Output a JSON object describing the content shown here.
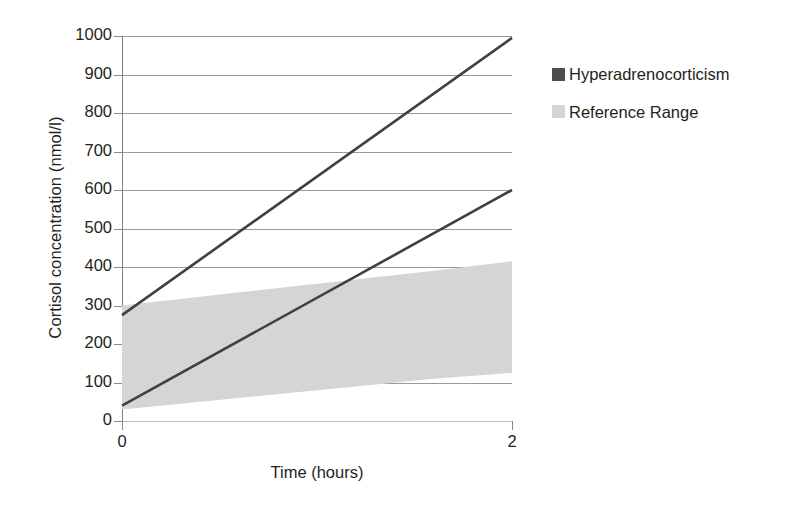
{
  "chart_data": {
    "type": "area",
    "title": "",
    "xlabel": "Time (hours)",
    "ylabel": "Cortisol concentration (nmol/l)",
    "xlim": [
      0,
      2
    ],
    "ylim": [
      0,
      1000
    ],
    "x_ticks": [
      "0",
      "2"
    ],
    "x_tick_values": [
      0,
      2
    ],
    "y_ticks": [
      "0",
      "100",
      "200",
      "300",
      "400",
      "500",
      "600",
      "700",
      "800",
      "900",
      "1000"
    ],
    "y_tick_values": [
      0,
      100,
      200,
      300,
      400,
      500,
      600,
      700,
      800,
      900,
      1000
    ],
    "grid": true,
    "legend_position": "right",
    "series": [
      {
        "name": "Hyperadrenocorticism",
        "kind": "line",
        "color": "#404040",
        "note": "upper diagnostic line",
        "x": [
          0,
          2
        ],
        "values": [
          275,
          995
        ]
      },
      {
        "name": "Hyperadrenocorticism",
        "kind": "line",
        "color": "#404040",
        "note": "lower diagnostic line",
        "x": [
          0,
          2
        ],
        "values": [
          40,
          600
        ]
      },
      {
        "name": "Reference Range",
        "kind": "band",
        "color": "#d5d5d5",
        "x": [
          0,
          1.6,
          2
        ],
        "upper": [
          300,
          390,
          415
        ],
        "lower": [
          30,
          110,
          125
        ]
      }
    ]
  },
  "legend": {
    "items": [
      {
        "label": "Hyperadrenocorticism",
        "color": "#4d4d4d"
      },
      {
        "label": "Reference Range",
        "color": "#d5d5d5"
      }
    ]
  },
  "axes": {
    "y_title": "Cortisol concentration (nmol/l)",
    "x_title": "Time (hours)"
  }
}
